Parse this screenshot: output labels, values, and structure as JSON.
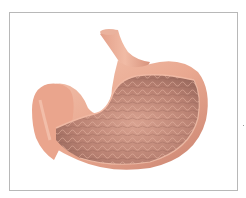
{
  "figure": {
    "alt": "Anatomical illustration of a stomach cut open showing rugae folds on the inner lining",
    "parts": [
      {
        "name": "esophagus",
        "label": ""
      },
      {
        "name": "fundus-wall",
        "label": ""
      },
      {
        "name": "rugae-lining",
        "label": ""
      },
      {
        "name": "pylorus",
        "label": ""
      }
    ],
    "colors": {
      "outer_wall": "#e9a890",
      "outer_wall_light": "#f3c3ae",
      "outer_wall_shadow": "#c98370",
      "lining_dark": "#9c6a5e",
      "lining_mid": "#b98172",
      "lining_light": "#d9a290",
      "frame_border": "#b8b8b8",
      "background": "#ffffff"
    }
  }
}
